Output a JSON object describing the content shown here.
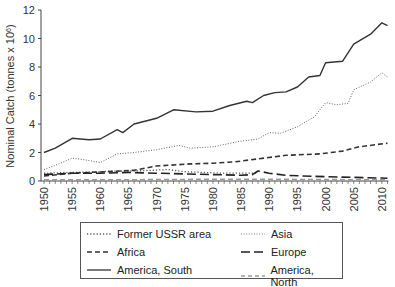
{
  "chart_data": {
    "type": "line",
    "title": "",
    "xlabel": "",
    "ylabel": "Nominal Catch (tonnes x 10",
    "ylabel_superscript": "6",
    "ylabel_close": ")",
    "ylim": [
      0,
      12
    ],
    "xlim": [
      1950,
      2011
    ],
    "grid": false,
    "legend_position": "bottom",
    "y_ticks": [
      0,
      2,
      4,
      6,
      8,
      10,
      12
    ],
    "x_ticks": [
      1950,
      1955,
      1960,
      1965,
      1970,
      1975,
      1980,
      1985,
      1990,
      1995,
      2000,
      2005,
      2010
    ],
    "series": [
      {
        "name": "Former USSR area",
        "style": "dotted",
        "color": "#555555",
        "x": [
          1950,
          1955,
          1960,
          1963,
          1966,
          1969,
          1972,
          1975,
          1978,
          1982,
          1985,
          1988
        ],
        "values": [
          0.55,
          0.6,
          0.65,
          0.7,
          0.7,
          0.75,
          0.8,
          0.65,
          0.6,
          0.55,
          0.55,
          0.55
        ]
      },
      {
        "name": "Asia",
        "style": "dotted-fine",
        "color": "#666666",
        "x": [
          1950,
          1952,
          1955,
          1957,
          1960,
          1963,
          1966,
          1970,
          1974,
          1976,
          1980,
          1985,
          1988,
          1990,
          1992,
          1995,
          1998,
          2000,
          2002,
          2004,
          2005,
          2008,
          2010,
          2011
        ],
        "values": [
          0.8,
          1.1,
          1.6,
          1.5,
          1.3,
          1.9,
          2.0,
          2.2,
          2.5,
          2.3,
          2.4,
          2.8,
          2.95,
          3.4,
          3.35,
          3.8,
          4.5,
          5.5,
          5.35,
          5.45,
          6.4,
          6.95,
          7.6,
          7.3
        ]
      },
      {
        "name": "Africa",
        "style": "dashed",
        "color": "#333333",
        "x": [
          1950,
          1955,
          1961,
          1966,
          1970,
          1976,
          1980,
          1984,
          1988,
          1993,
          1999,
          2003,
          2006,
          2011
        ],
        "values": [
          0.35,
          0.55,
          0.65,
          0.75,
          1.05,
          1.2,
          1.25,
          1.35,
          1.55,
          1.8,
          1.9,
          2.1,
          2.4,
          2.65
        ]
      },
      {
        "name": "Europe",
        "style": "long-dash",
        "color": "#222222",
        "x": [
          1950,
          1955,
          1960,
          1965,
          1970,
          1975,
          1980,
          1985,
          1987,
          1988,
          1990,
          1993,
          1996,
          2000,
          2005,
          2011
        ],
        "values": [
          0.45,
          0.55,
          0.55,
          0.6,
          0.55,
          0.5,
          0.45,
          0.4,
          0.45,
          0.7,
          0.55,
          0.4,
          0.35,
          0.3,
          0.25,
          0.2
        ]
      },
      {
        "name": "America, South",
        "style": "solid",
        "color": "#333333",
        "x": [
          1950,
          1952,
          1955,
          1958,
          1960,
          1963,
          1964,
          1966,
          1970,
          1973,
          1977,
          1980,
          1983,
          1986,
          1987,
          1989,
          1991,
          1993,
          1995,
          1997,
          1999,
          2000,
          2003,
          2005,
          2008,
          2010,
          2011
        ],
        "values": [
          2.0,
          2.3,
          3.0,
          2.9,
          2.95,
          3.6,
          3.4,
          4.0,
          4.4,
          5.0,
          4.85,
          4.9,
          5.3,
          5.6,
          5.5,
          6.0,
          6.2,
          6.25,
          6.6,
          7.3,
          7.4,
          8.3,
          8.4,
          9.6,
          10.3,
          11.1,
          10.9
        ]
      },
      {
        "name": "America, North",
        "style": "dashed",
        "color": "#999999",
        "x": [
          1950,
          1960,
          1970,
          1980,
          1990,
          2000,
          2011
        ],
        "values": [
          0.08,
          0.08,
          0.1,
          0.12,
          0.12,
          0.1,
          0.08
        ]
      }
    ]
  },
  "legend": {
    "items": [
      {
        "label": "Former USSR area"
      },
      {
        "label": "Asia"
      },
      {
        "label": "Africa"
      },
      {
        "label": "Europe"
      },
      {
        "label": "America, South"
      },
      {
        "label": "America, North"
      }
    ]
  }
}
